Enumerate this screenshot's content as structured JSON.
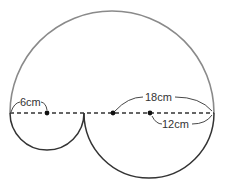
{
  "diagram": {
    "type": "geometry-figure",
    "labels": {
      "small_radius": "6cm",
      "large_radius": "18cm",
      "medium_radius": "12cm"
    },
    "shapes": [
      {
        "name": "large-semicircle",
        "radius_label": "18cm",
        "side": "top",
        "color": "#8a8a8a"
      },
      {
        "name": "small-semicircle",
        "radius_label": "6cm",
        "side": "bottom",
        "color": "#333333"
      },
      {
        "name": "medium-semicircle",
        "radius_label": "12cm",
        "side": "bottom",
        "color": "#333333"
      }
    ],
    "colors": {
      "large_arc": "#8a8a8a",
      "small_arcs": "#333333",
      "dashed_line": "#333333",
      "dots": "#111111"
    }
  }
}
